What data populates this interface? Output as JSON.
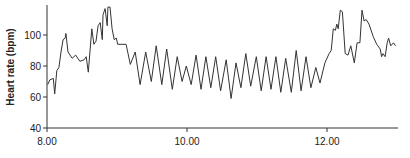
{
  "chart_data": {
    "type": "line",
    "title": "",
    "xlabel": "",
    "ylabel": "Heart rate (bpm)",
    "xlim": [
      8.0,
      13.0
    ],
    "ylim": [
      40,
      118
    ],
    "grid": false,
    "legend": null,
    "x_ticks": [
      {
        "value": 8.0,
        "label": "8.00"
      },
      {
        "value": 10.0,
        "label": "10.00"
      },
      {
        "value": 12.0,
        "label": "12.00"
      }
    ],
    "y_ticks": [
      {
        "value": 40,
        "label": "40"
      },
      {
        "value": 60,
        "label": "60"
      },
      {
        "value": 80,
        "label": "80"
      },
      {
        "value": 100,
        "label": "100"
      }
    ],
    "series": [
      {
        "name": "Heart rate",
        "color": "#333333",
        "points": [
          [
            8.01,
            68
          ],
          [
            8.04,
            71
          ],
          [
            8.09,
            72
          ],
          [
            8.11,
            62
          ],
          [
            8.14,
            77
          ],
          [
            8.17,
            79
          ],
          [
            8.2,
            89
          ],
          [
            8.23,
            97
          ],
          [
            8.26,
            98
          ],
          [
            8.27,
            101
          ],
          [
            8.3,
            89
          ],
          [
            8.36,
            85
          ],
          [
            8.41,
            87
          ],
          [
            8.47,
            83
          ],
          [
            8.53,
            84
          ],
          [
            8.56,
            86
          ],
          [
            8.59,
            76
          ],
          [
            8.64,
            104
          ],
          [
            8.67,
            94
          ],
          [
            8.7,
            96
          ],
          [
            8.73,
            106
          ],
          [
            8.76,
            108
          ],
          [
            8.79,
            97
          ],
          [
            8.8,
            113
          ],
          [
            8.83,
            117
          ],
          [
            8.86,
            106
          ],
          [
            8.87,
            118
          ],
          [
            8.9,
            118
          ],
          [
            8.93,
            104
          ],
          [
            8.96,
            97
          ],
          [
            8.99,
            98
          ],
          [
            9.01,
            94
          ],
          [
            9.07,
            94
          ],
          [
            9.13,
            94
          ],
          [
            9.19,
            81
          ],
          [
            9.26,
            89
          ],
          [
            9.33,
            68
          ],
          [
            9.41,
            89
          ],
          [
            9.49,
            70
          ],
          [
            9.56,
            93
          ],
          [
            9.64,
            68
          ],
          [
            9.71,
            91
          ],
          [
            9.79,
            65
          ],
          [
            9.86,
            86
          ],
          [
            9.93,
            70
          ],
          [
            9.99,
            80
          ],
          [
            10.06,
            68
          ],
          [
            10.13,
            87
          ],
          [
            10.2,
            65
          ],
          [
            10.27,
            86
          ],
          [
            10.34,
            66
          ],
          [
            10.41,
            86
          ],
          [
            10.48,
            64
          ],
          [
            10.56,
            84
          ],
          [
            10.63,
            59
          ],
          [
            10.7,
            82
          ],
          [
            10.77,
            66
          ],
          [
            10.84,
            88
          ],
          [
            10.91,
            67
          ],
          [
            10.99,
            86
          ],
          [
            11.06,
            64
          ],
          [
            11.13,
            86
          ],
          [
            11.2,
            65
          ],
          [
            11.27,
            86
          ],
          [
            11.34,
            63
          ],
          [
            11.41,
            85
          ],
          [
            11.49,
            63
          ],
          [
            11.56,
            90
          ],
          [
            11.63,
            64
          ],
          [
            11.7,
            86
          ],
          [
            11.77,
            66
          ],
          [
            11.84,
            79
          ],
          [
            11.9,
            69
          ],
          [
            11.97,
            82
          ],
          [
            12.03,
            88
          ],
          [
            12.06,
            90
          ],
          [
            12.09,
            104
          ],
          [
            12.12,
            103
          ],
          [
            12.14,
            107
          ],
          [
            12.16,
            104
          ],
          [
            12.19,
            116
          ],
          [
            12.22,
            115
          ],
          [
            12.26,
            88
          ],
          [
            12.3,
            87
          ],
          [
            12.34,
            93
          ],
          [
            12.39,
            82
          ],
          [
            12.43,
            95
          ],
          [
            12.47,
            95
          ],
          [
            12.5,
            116
          ],
          [
            12.53,
            109
          ],
          [
            12.56,
            110
          ],
          [
            12.6,
            107
          ],
          [
            12.66,
            99
          ],
          [
            12.71,
            94
          ],
          [
            12.76,
            91
          ],
          [
            12.78,
            86
          ],
          [
            12.8,
            88
          ],
          [
            12.83,
            86
          ],
          [
            12.86,
            95
          ],
          [
            12.88,
            98
          ],
          [
            12.91,
            93
          ],
          [
            12.95,
            95
          ],
          [
            12.98,
            93
          ]
        ]
      }
    ]
  }
}
